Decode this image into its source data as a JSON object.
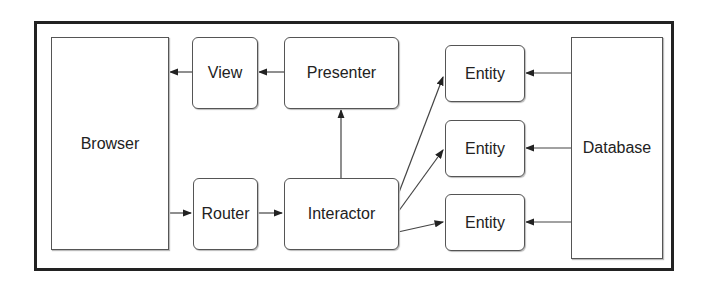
{
  "diagram": {
    "nodes": {
      "browser": "Browser",
      "view": "View",
      "presenter": "Presenter",
      "router": "Router",
      "interactor": "Interactor",
      "entity1": "Entity",
      "entity2": "Entity",
      "entity3": "Entity",
      "database": "Database"
    },
    "edges": [
      {
        "from": "View",
        "to": "Browser"
      },
      {
        "from": "Presenter",
        "to": "View"
      },
      {
        "from": "Interactor",
        "to": "Presenter"
      },
      {
        "from": "Browser",
        "to": "Router"
      },
      {
        "from": "Router",
        "to": "Interactor"
      },
      {
        "from": "Interactor",
        "to": "Entity (top)"
      },
      {
        "from": "Interactor",
        "to": "Entity (middle)"
      },
      {
        "from": "Interactor",
        "to": "Entity (bottom)"
      },
      {
        "from": "Database",
        "to": "Entity (top)"
      },
      {
        "from": "Database",
        "to": "Entity (middle)"
      },
      {
        "from": "Database",
        "to": "Entity (bottom)"
      }
    ],
    "colors": {
      "stroke": "#555555",
      "frame": "#222222",
      "text": "#222222"
    }
  }
}
